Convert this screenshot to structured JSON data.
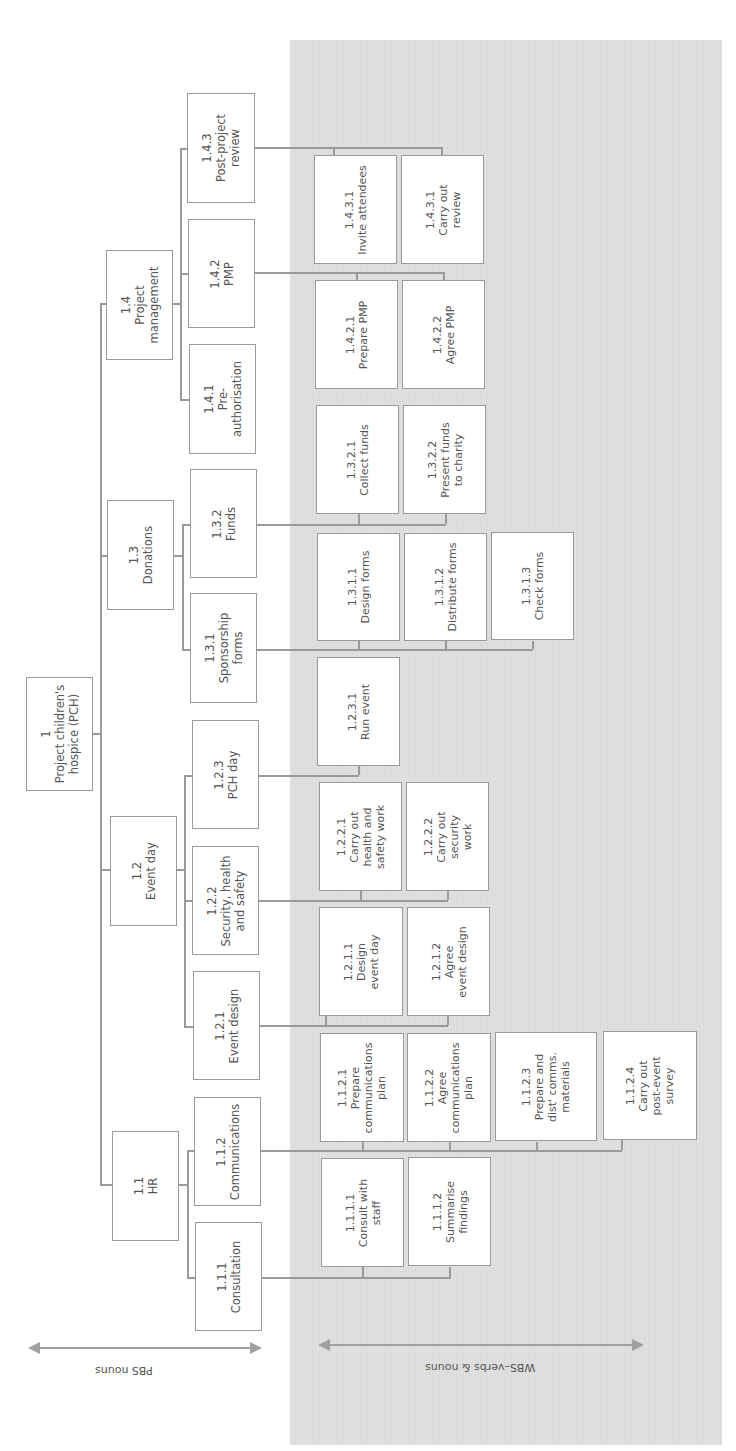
{
  "root": {
    "code": "1",
    "label": "Project children's\nhospice (PCH)"
  },
  "pbs_level2": [
    {
      "code": "1.1",
      "label": "HR"
    },
    {
      "code": "1.2",
      "label": "Event day"
    },
    {
      "code": "1.3",
      "label": "Donations"
    },
    {
      "code": "1.4",
      "label": "Project\nmanagement"
    }
  ],
  "pbs_level3": [
    {
      "code": "1.1.1",
      "label": "Consultation"
    },
    {
      "code": "1.1.2",
      "label": "Communications"
    },
    {
      "code": "1.2.1",
      "label": "Event design"
    },
    {
      "code": "1.2.2",
      "label": "Security, health\nand safety"
    },
    {
      "code": "1.2.3",
      "label": "PCH day"
    },
    {
      "code": "1.3.1",
      "label": "Sponsorship\nforms"
    },
    {
      "code": "1.3.2",
      "label": "Funds"
    },
    {
      "code": "1.4.1",
      "label": "Pre-\nauthorisation"
    },
    {
      "code": "1.4.2",
      "label": "PMP"
    },
    {
      "code": "1.4.3",
      "label": "Post-project\nreview"
    }
  ],
  "wbs": [
    {
      "code": "1.1.1.1",
      "label": "Consult with\nstaff"
    },
    {
      "code": "1.1.1.2",
      "label": "Summarise\nfindings"
    },
    {
      "code": "1.1.2.1",
      "label": "Prepare\ncommunications\nplan"
    },
    {
      "code": "1.1.2.2",
      "label": "Agree\ncommunications\nplan"
    },
    {
      "code": "1.1.2.3",
      "label": "Prepare and\ndist' comms.\nmaterials"
    },
    {
      "code": "1.1.2.4",
      "label": "Carry out\npost-event\nsurvey"
    },
    {
      "code": "1.2.1.1",
      "label": "Design\nevent day"
    },
    {
      "code": "1.2.1.2",
      "label": "Agree\nevent design"
    },
    {
      "code": "1.2.2.1",
      "label": "Carry out\nhealth and\nsafety work"
    },
    {
      "code": "1.2.2.2",
      "label": "Carry out\nsecurity\nwork"
    },
    {
      "code": "1.2.3.1",
      "label": "Run event"
    },
    {
      "code": "1.3.1.1",
      "label": "Design forms"
    },
    {
      "code": "1.3.1.2",
      "label": "Distribute forms"
    },
    {
      "code": "1.3.1.3",
      "label": "Check forms"
    },
    {
      "code": "1.3.2.1",
      "label": "Collect funds"
    },
    {
      "code": "1.3.2.2",
      "label": "Present funds\nto charity"
    },
    {
      "code": "1.4.2.1",
      "label": "Prepare PMP"
    },
    {
      "code": "1.4.2.2",
      "label": "Agree PMP"
    },
    {
      "code": "1.4.3.1",
      "label": "Invite attendees"
    },
    {
      "code": "1.4.3.1b",
      "label": "Carry out\nreview",
      "display_code": "1.4.3.1"
    }
  ],
  "axes": {
    "pbs_label": "PBS nouns",
    "wbs_label": "WBS–verbs & nouns"
  },
  "colors": {
    "panel": "#dcdcdc",
    "box_border": "#9a9a9a",
    "line": "#9a9a9a",
    "text": "#555555"
  }
}
